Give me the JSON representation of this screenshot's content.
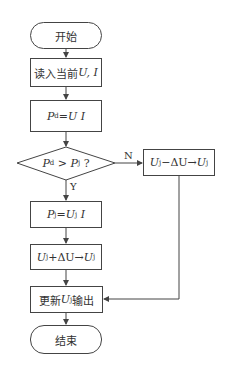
{
  "flowchart": {
    "start": {
      "label": "开始"
    },
    "read": {
      "prefix": "读入当前",
      "vars": "U, I"
    },
    "pd": {
      "lhs": "P",
      "lhs_sub": "d",
      "eq": "=",
      "rhs": "U I"
    },
    "decision": {
      "a": "P",
      "a_sub": "d",
      "op": " > ",
      "b": "P",
      "b_sub": "j",
      "q": " ?"
    },
    "branch_yes": "Y",
    "branch_no": "N",
    "pj": {
      "lhs": "P",
      "lhs_sub": "j",
      "eq": "=",
      "u": "U",
      "u_sub": "j",
      "rest": " I"
    },
    "inc": {
      "u": "U",
      "u_sub": "j",
      "op": "+ΔU",
      "arrow": "→",
      "t": "U",
      "t_sub": "j"
    },
    "dec": {
      "u": "U",
      "u_sub": "j",
      "op": "−ΔU",
      "arrow": "→",
      "t": "U",
      "t_sub": "j"
    },
    "update": {
      "prefix": "更新",
      "u": "U",
      "u_sub": "j",
      "suffix": "输出"
    },
    "end": {
      "label": "结束"
    }
  },
  "colors": {
    "stroke": "#444444",
    "text": "#333333",
    "background": "#ffffff"
  }
}
